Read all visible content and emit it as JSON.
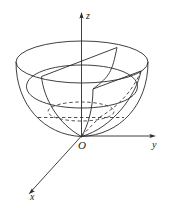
{
  "figure": {
    "kind": "3d-coordinate-diagram",
    "background_color": "#ffffff",
    "stroke_color": "#1a1a1a",
    "axes": {
      "z": {
        "label": "z",
        "direction": "up",
        "arrow": true
      },
      "y": {
        "label": "y",
        "direction": "right",
        "arrow": true
      },
      "x": {
        "label": "x",
        "direction": "down-left",
        "arrow": true
      }
    },
    "origin": {
      "label": "O"
    },
    "elements": [
      {
        "name": "top-rim-ellipse",
        "style": "solid"
      },
      {
        "name": "bowl-left-profile",
        "style": "solid"
      },
      {
        "name": "bowl-right-profile",
        "style": "solid"
      },
      {
        "name": "mid-cross-section-ellipse",
        "style": "solid"
      },
      {
        "name": "wedge-sector-top",
        "style": "solid"
      },
      {
        "name": "wedge-radial-edge-left",
        "style": "solid"
      },
      {
        "name": "wedge-radial-edge-right",
        "style": "solid"
      },
      {
        "name": "inner-ellipse-hidden",
        "style": "dashed"
      },
      {
        "name": "horizontal-level-line-hidden",
        "style": "dashed"
      },
      {
        "name": "wedge-hidden-edge",
        "style": "dashed"
      }
    ]
  }
}
